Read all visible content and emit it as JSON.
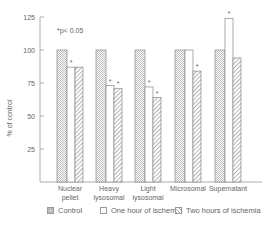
{
  "chart_data": {
    "type": "bar",
    "title": "",
    "annotation": "*p< 0.05",
    "xlabel": "",
    "ylabel": "% of control",
    "ylim": [
      0,
      125
    ],
    "yticks": [
      25,
      50,
      75,
      100,
      125
    ],
    "grid": false,
    "legend_position": "bottom",
    "categories": [
      "Nuclear pellet",
      "Heavy lysosomal",
      "Light lysosomal",
      "Microsomal",
      "Supernatant"
    ],
    "category_lines": [
      [
        "Nuclear",
        "pellet"
      ],
      [
        "Heavy",
        "lysosomal"
      ],
      [
        "Light",
        "lysosomal"
      ],
      [
        "Microsomal"
      ],
      [
        "Supernatant"
      ]
    ],
    "series": [
      {
        "name": "Control",
        "values": [
          100,
          100,
          100,
          100,
          100
        ],
        "significant": [
          false,
          false,
          false,
          false,
          false
        ]
      },
      {
        "name": "One hour of ischemia",
        "values": [
          87,
          73,
          72,
          100,
          124
        ],
        "significant": [
          true,
          true,
          true,
          false,
          true
        ]
      },
      {
        "name": "Two hours of ischemia",
        "values": [
          87,
          71,
          64,
          84,
          94
        ],
        "significant": [
          false,
          true,
          true,
          true,
          false
        ]
      }
    ]
  },
  "legend": {
    "control": "Control",
    "one_hour": "One hour of ischemia",
    "two_hours": "Two hours of ischemia"
  },
  "colors": {
    "axis": "#999999",
    "bar_outline": "#888888",
    "hatch": "#bbbbbb"
  }
}
